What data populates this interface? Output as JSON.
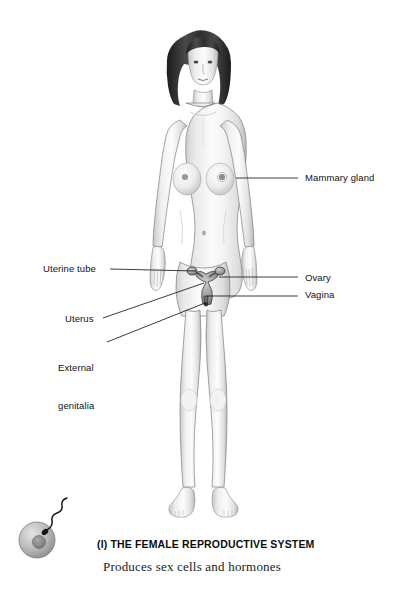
{
  "figure": {
    "background_color": "#ffffff",
    "illustration_style": "grayscale anatomical illustration",
    "body_outline_color": "#6e6e6e",
    "skin_fill_color": "#f2f2f2",
    "hair_color": "#2b2b2b",
    "leader_line_color": "#1a1a1a"
  },
  "labels": [
    {
      "id": "mammary-gland",
      "text": "Mammary gland",
      "side": "right",
      "text_x": 305,
      "text_y": 172,
      "line": {
        "x1": 236,
        "y1": 178,
        "x2": 298,
        "y2": 178
      }
    },
    {
      "id": "ovary",
      "text": "Ovary",
      "side": "right",
      "text_x": 305,
      "text_y": 272,
      "line": {
        "x1": 216,
        "y1": 278,
        "x2": 298,
        "y2": 278
      }
    },
    {
      "id": "vagina",
      "text": "Vagina",
      "side": "right",
      "text_x": 305,
      "text_y": 289,
      "line": {
        "x1": 208,
        "y1": 295,
        "x2": 298,
        "y2": 295
      }
    },
    {
      "id": "uterine-tube",
      "text": "Uterine tube",
      "side": "left",
      "text_x": 43,
      "text_y": 263,
      "line": {
        "x1": 110,
        "y1": 269,
        "x2": 200,
        "y2": 272
      }
    },
    {
      "id": "uterus",
      "text": "Uterus",
      "side": "left",
      "text_x": 65,
      "text_y": 313,
      "line": {
        "x1": 103,
        "y1": 319,
        "x2": 205,
        "y2": 283
      }
    },
    {
      "id": "external-genitalia",
      "text": "External\ngenitalia",
      "line1": "External",
      "line2": "genitalia",
      "side": "left",
      "text_x": 58,
      "text_y": 337,
      "line": {
        "x1": 107,
        "y1": 343,
        "x2": 205,
        "y2": 302
      }
    }
  ],
  "organ_overlay": {
    "description": "uterus with fallopian tubes and ovaries, vagina",
    "uterus_center_x": 206,
    "uterus_center_y": 281,
    "ovary_left_x": 194,
    "ovary_left_y": 272,
    "ovary_right_x": 218,
    "ovary_right_y": 272,
    "fill_color": "#9a9a9a",
    "stroke_color": "#3a3a3a"
  },
  "ovum_icon": {
    "name": "ovum-with-sperm-icon",
    "description": "egg cell being approached by a sperm",
    "center_x": 37,
    "center_y": 540,
    "radius": 18,
    "nucleus_radius": 6,
    "cell_fill": "#b7b7b7",
    "nucleus_fill": "#8a8a8a",
    "sperm_color": "#1c1c1c"
  },
  "caption": {
    "title": "(l) THE FEMALE REPRODUCTIVE SYSTEM",
    "subtitle": "Produces sex cells and hormones"
  }
}
